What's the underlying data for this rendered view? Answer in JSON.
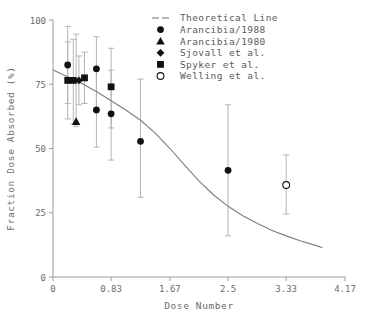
{
  "chart_data": {
    "type": "scatter",
    "title": "",
    "xlabel": "Dose Number",
    "ylabel": "Fraction Dose Absorbed (%)",
    "xlim": [
      0,
      4.17
    ],
    "ylim": [
      0,
      100
    ],
    "xticks": [
      "0",
      "0.83",
      "1.67",
      "2.5",
      "3.33",
      "4.17"
    ],
    "xtick_values": [
      0,
      0.83,
      1.67,
      2.5,
      3.33,
      4.17
    ],
    "yticks": [
      "0",
      "25",
      "50",
      "75",
      "100"
    ],
    "ytick_values": [
      0,
      25,
      50,
      75,
      100
    ],
    "grid": false,
    "legend_position": "top-right",
    "legend": [
      {
        "label": "Theoretical Line",
        "marker": "line"
      },
      {
        "label": "Arancibia/1988",
        "marker": "circle-filled"
      },
      {
        "label": "Arancibia/1980",
        "marker": "triangle-filled"
      },
      {
        "label": "Sjovall et al.",
        "marker": "diamond-filled"
      },
      {
        "label": "Spyker et al.",
        "marker": "square-filled"
      },
      {
        "label": "Welling et al.",
        "marker": "circle-open"
      }
    ],
    "series": [
      {
        "name": "Theoretical Line",
        "marker": "line",
        "points": [
          {
            "x": 0.0,
            "y": 80.5
          },
          {
            "x": 0.2,
            "y": 78.0
          },
          {
            "x": 0.42,
            "y": 75.2
          },
          {
            "x": 0.63,
            "y": 72.0
          },
          {
            "x": 0.83,
            "y": 68.6
          },
          {
            "x": 1.04,
            "y": 65.0
          },
          {
            "x": 1.25,
            "y": 61.0
          },
          {
            "x": 1.46,
            "y": 56.0
          },
          {
            "x": 1.67,
            "y": 50.0
          },
          {
            "x": 1.88,
            "y": 43.5
          },
          {
            "x": 2.08,
            "y": 37.5
          },
          {
            "x": 2.29,
            "y": 32.0
          },
          {
            "x": 2.5,
            "y": 27.5
          },
          {
            "x": 2.71,
            "y": 23.8
          },
          {
            "x": 2.92,
            "y": 20.8
          },
          {
            "x": 3.12,
            "y": 18.2
          },
          {
            "x": 3.33,
            "y": 16.0
          },
          {
            "x": 3.54,
            "y": 14.0
          },
          {
            "x": 3.75,
            "y": 12.3
          },
          {
            "x": 3.85,
            "y": 11.4
          }
        ]
      },
      {
        "name": "Arancibia/1988",
        "marker": "circle-filled",
        "points": [
          {
            "x": 0.21,
            "y": 82.5,
            "ylo": 67.5,
            "yhi": 97.5
          },
          {
            "x": 0.62,
            "y": 81.0,
            "ylo": 65.0,
            "yhi": 93.5
          },
          {
            "x": 0.62,
            "y": 65.0,
            "ylo": 50.5,
            "yhi": 80.0
          },
          {
            "x": 0.83,
            "y": 63.5,
            "ylo": 45.5,
            "yhi": 80.5
          },
          {
            "x": 1.25,
            "y": 52.8,
            "ylo": 31.0,
            "yhi": 77.0
          },
          {
            "x": 2.5,
            "y": 41.5,
            "ylo": 16.0,
            "yhi": 67.0
          }
        ]
      },
      {
        "name": "Arancibia/1980",
        "marker": "triangle-filled",
        "points": [
          {
            "x": 0.33,
            "y": 60.5,
            "ylo": 58.5,
            "yhi": 94.5
          }
        ]
      },
      {
        "name": "Sjovall et al.",
        "marker": "diamond-filled",
        "points": [
          {
            "x": 0.37,
            "y": 76.5,
            "ylo": 67.0,
            "yhi": 86.0
          }
        ]
      },
      {
        "name": "Spyker et al.",
        "marker": "square-filled",
        "points": [
          {
            "x": 0.21,
            "y": 76.5,
            "ylo": 61.5,
            "yhi": 91.5
          },
          {
            "x": 0.29,
            "y": 76.5,
            "ylo": 59.5,
            "yhi": 92.5
          },
          {
            "x": 0.45,
            "y": 77.5,
            "ylo": 67.5,
            "yhi": 87.5
          },
          {
            "x": 0.83,
            "y": 74.0,
            "ylo": 58.0,
            "yhi": 89.0
          }
        ]
      },
      {
        "name": "Welling et al.",
        "marker": "circle-open",
        "points": [
          {
            "x": 3.33,
            "y": 35.8,
            "ylo": 24.5,
            "yhi": 47.5
          }
        ]
      }
    ]
  },
  "colors": {
    "marker": "#111111",
    "axis": "#9a9a9a",
    "errorbar": "#b4b4b4",
    "theoretical_line": "#7d7d7d",
    "text": "#5a5a5a",
    "background": "#ffffff"
  }
}
